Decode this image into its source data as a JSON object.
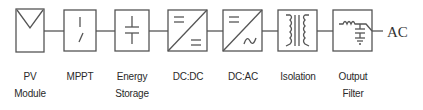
{
  "diagram": {
    "type": "block-diagram",
    "title": "",
    "stroke_color": "#555555",
    "blocks": [
      {
        "id": "pv",
        "label_line1": "PV",
        "label_line2": "Module",
        "symbol": "pv-panel-icon"
      },
      {
        "id": "mppt",
        "label_line1": "MPPT",
        "label_line2": "",
        "symbol": "switch-icon"
      },
      {
        "id": "storage",
        "label_line1": "Energy",
        "label_line2": "Storage",
        "symbol": "capacitor-icon"
      },
      {
        "id": "dcdc",
        "label_line1": "DC:DC",
        "label_line2": "",
        "symbol": "dc-dc-converter-icon"
      },
      {
        "id": "dcac",
        "label_line1": "DC:AC",
        "label_line2": "",
        "symbol": "inverter-icon"
      },
      {
        "id": "isolation",
        "label_line1": "Isolation",
        "label_line2": "",
        "symbol": "transformer-icon"
      },
      {
        "id": "filter",
        "label_line1": "Output",
        "label_line2": "Filter",
        "symbol": "lc-filter-icon"
      }
    ],
    "output_label": "AC",
    "connections": [
      [
        "pv",
        "mppt"
      ],
      [
        "mppt",
        "storage"
      ],
      [
        "storage",
        "dcdc"
      ],
      [
        "dcdc",
        "dcac"
      ],
      [
        "dcac",
        "isolation"
      ],
      [
        "isolation",
        "filter"
      ],
      [
        "filter",
        "AC"
      ]
    ]
  }
}
